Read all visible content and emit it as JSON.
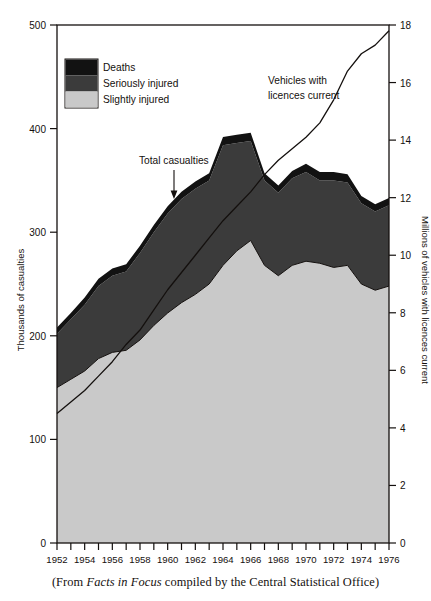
{
  "caption": {
    "prefix": "(From ",
    "source_title": "Facts in Focus",
    "suffix": " compiled by the Central Statistical Office)"
  },
  "legend": {
    "items": [
      {
        "label": "Deaths",
        "color": "#121212"
      },
      {
        "label": "Seriously injured",
        "color": "#3b3b3b"
      },
      {
        "label": "Slightly injured",
        "color": "#c9c9c9"
      }
    ]
  },
  "annotations": {
    "total_casualties": "Total casualties",
    "vehicles_line1": "Vehicles with",
    "vehicles_line2": "licences current"
  },
  "axes": {
    "left_title": "Thousands of casualties",
    "right_title": "Millions of vehicles with licences current",
    "left_ticks": [
      "0",
      "100",
      "200",
      "300",
      "400",
      "500"
    ],
    "right_ticks": [
      "0",
      "2",
      "4",
      "6",
      "8",
      "10",
      "12",
      "14",
      "16",
      "18"
    ],
    "x_ticks": [
      "1952",
      "1954",
      "1956",
      "1958",
      "1960",
      "1962",
      "1964",
      "1966",
      "1968",
      "1970",
      "1972",
      "1974",
      "1976"
    ]
  },
  "chart_data": {
    "type": "area",
    "title": "",
    "xlabel": "",
    "ylabel": "Thousands of casualties",
    "y2label": "Millions of vehicles with licences current",
    "ylim": [
      0,
      500
    ],
    "y2lim": [
      0,
      18
    ],
    "xlim": [
      1952,
      1976
    ],
    "grid": false,
    "legend_position": "top-left",
    "x": [
      1952,
      1953,
      1954,
      1955,
      1956,
      1957,
      1958,
      1959,
      1960,
      1961,
      1962,
      1963,
      1964,
      1965,
      1966,
      1967,
      1968,
      1969,
      1970,
      1971,
      1972,
      1973,
      1974,
      1975,
      1976
    ],
    "series": [
      {
        "name": "Slightly injured",
        "color": "#c9c9c9",
        "stacked": true,
        "values": [
          150,
          158,
          166,
          178,
          184,
          186,
          196,
          210,
          222,
          232,
          240,
          250,
          268,
          282,
          292,
          268,
          258,
          268,
          272,
          270,
          266,
          268,
          250,
          244,
          248
        ]
      },
      {
        "name": "Seriously injured",
        "color": "#3b3b3b",
        "stacked": true,
        "values": [
          52,
          58,
          64,
          70,
          74,
          76,
          84,
          90,
          96,
          100,
          102,
          100,
          116,
          104,
          96,
          82,
          80,
          84,
          86,
          80,
          84,
          80,
          78,
          76,
          78
        ]
      },
      {
        "name": "Deaths",
        "color": "#121212",
        "stacked": true,
        "values": [
          6,
          6,
          7,
          7,
          7,
          7,
          7,
          7,
          7,
          7,
          7,
          7,
          8,
          8,
          8,
          7,
          7,
          7,
          8,
          8,
          8,
          8,
          7,
          7,
          7
        ]
      },
      {
        "name": "Total casualties",
        "color": "#121212",
        "stacked": false,
        "note": "sum of the three stacked bands",
        "values": [
          208,
          222,
          237,
          255,
          265,
          269,
          287,
          307,
          325,
          339,
          349,
          357,
          392,
          394,
          396,
          357,
          345,
          359,
          366,
          358,
          358,
          356,
          335,
          327,
          333
        ]
      },
      {
        "name": "Vehicles with licences current",
        "axis": "right",
        "color": "#14100e",
        "type": "line",
        "values": [
          4.5,
          4.9,
          5.3,
          5.8,
          6.3,
          6.9,
          7.4,
          8.1,
          8.8,
          9.4,
          10.0,
          10.6,
          11.2,
          11.7,
          12.2,
          12.8,
          13.3,
          13.7,
          14.1,
          14.6,
          15.4,
          16.4,
          17.0,
          17.3,
          17.8
        ]
      }
    ]
  }
}
